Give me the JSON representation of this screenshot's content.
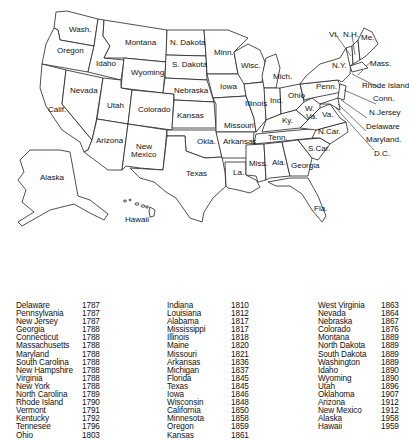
{
  "map": {
    "title": "United States map with state admission dates",
    "labels": {
      "wash": "Wash.",
      "oregon": "Oregon",
      "calif": "Calif.",
      "idaho": "Idaho",
      "nevada": "Nevada",
      "montana": "Montana",
      "wyoming": "Wyoming",
      "utah": "Utah",
      "arizona": "Arizona",
      "colorado": "Colorado",
      "new_mexico_1": "New",
      "new_mexico_2": "Mexico",
      "n_dakota": "N. Dakota",
      "s_dakota": "S. Dakota",
      "nebraska": "Nebraska",
      "kansas": "Kansas",
      "okla": "Okla.",
      "texas": "Texas",
      "minn": "Minn.",
      "iowa": "Iowa",
      "missouri": "Missouri",
      "arkansas": "Arkansas",
      "la": "La.",
      "wisc": "Wisc.",
      "illinois": "Illinois",
      "mich": "Mich.",
      "ind": "Ind.",
      "ohio": "Ohio",
      "ky": "Ky.",
      "tenn": "Tenn.",
      "miss": "Miss.",
      "ala": "Ala.",
      "georgia": "Georgia",
      "fla": "Fla.",
      "s_car": "S.Car.",
      "n_car": "N.Car.",
      "va": "Va.",
      "w_va_1": "W.",
      "w_va_2": "Va.",
      "penn": "Penn.",
      "ny": "N.Y.",
      "vt": "Vt.",
      "nh": "N.H.",
      "me": "Me.",
      "mass": "Mass.",
      "rhode_island": "Rhode Island",
      "conn": "Conn.",
      "n_jersey": "N.Jersey",
      "delaware": "Delaware",
      "maryland": "Maryland.",
      "dc": "D.C.",
      "alaska": "Alaska",
      "hawaii": "Hawaii"
    }
  },
  "admission_table": {
    "columns": [
      [
        {
          "state": "Delaware",
          "year": "1787"
        },
        {
          "state": "Pennsylvania",
          "year": "1787"
        },
        {
          "state": "New Jersey",
          "year": "1787"
        },
        {
          "state": "Georgia",
          "year": "1788"
        },
        {
          "state": "Connecticut",
          "year": "1788"
        },
        {
          "state": "Massachusetts",
          "year": "1788"
        },
        {
          "state": "Maryland",
          "year": "1788"
        },
        {
          "state": "South Carolina",
          "year": "1788"
        },
        {
          "state": "New Hampshire",
          "year": "1788"
        },
        {
          "state": "Virginia",
          "year": "1788"
        },
        {
          "state": "New York",
          "year": "1788"
        },
        {
          "state": "North Carolina",
          "year": "1789"
        },
        {
          "state": "Rhode Island",
          "year": "1790"
        },
        {
          "state": "Vermont",
          "year": "1791"
        },
        {
          "state": "Kentucky",
          "year": "1792"
        },
        {
          "state": "Tennesee",
          "year": "1796"
        },
        {
          "state": "Ohio",
          "year": "1803"
        }
      ],
      [
        {
          "state": "Indiana",
          "year": "1810"
        },
        {
          "state": "Louisiana",
          "year": "1812"
        },
        {
          "state": "Alabama",
          "year": "1817"
        },
        {
          "state": "Mississippi",
          "year": "1817"
        },
        {
          "state": "Illinois",
          "year": "1818"
        },
        {
          "state": "Maine",
          "year": "1820"
        },
        {
          "state": "Missouri",
          "year": "1821"
        },
        {
          "state": "Arkansas",
          "year": "1836"
        },
        {
          "state": "Michigan",
          "year": "1837"
        },
        {
          "state": "Florida",
          "year": "1845"
        },
        {
          "state": "Texas",
          "year": "1845"
        },
        {
          "state": "Iowa",
          "year": "1846"
        },
        {
          "state": "Wisconsin",
          "year": "1848"
        },
        {
          "state": "California",
          "year": "1850"
        },
        {
          "state": "Minnesota",
          "year": "1858"
        },
        {
          "state": "Oregon",
          "year": "1859"
        },
        {
          "state": "Kansas",
          "year": "1861"
        }
      ],
      [
        {
          "state": "West Virginia",
          "year": "1863"
        },
        {
          "state": "Nevada",
          "year": "1864"
        },
        {
          "state": "Nebraska",
          "year": "1867"
        },
        {
          "state": "Colorado",
          "year": "1876"
        },
        {
          "state": "Montana",
          "year": "1889"
        },
        {
          "state": "North Dakota",
          "year": "1889"
        },
        {
          "state": "South Dakota",
          "year": "1889"
        },
        {
          "state": "Washington",
          "year": "1889"
        },
        {
          "state": "Idaho",
          "year": "1890"
        },
        {
          "state": "Wyoming",
          "year": "1890"
        },
        {
          "state": "Utah",
          "year": "1896"
        },
        {
          "state": "Oklahoma",
          "year": "1907"
        },
        {
          "state": "Arizona",
          "year": "1912"
        },
        {
          "state": "New Mexico",
          "year": "1912"
        },
        {
          "state": "Alaska",
          "year": "1958"
        },
        {
          "state": "Hawaii",
          "year": "1959"
        }
      ]
    ]
  }
}
